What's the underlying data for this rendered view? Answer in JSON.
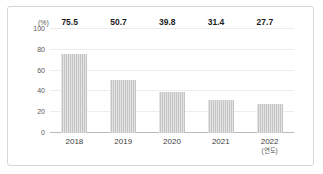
{
  "chart_data": {
    "type": "bar",
    "title": "",
    "xlabel": "(연도)",
    "ylabel": "(%)",
    "categories": [
      "2018",
      "2019",
      "2020",
      "2021",
      "2022"
    ],
    "values": [
      75.5,
      50.7,
      39.8,
      31.4,
      27.7
    ],
    "value_labels": [
      "75.5",
      "50.7",
      "39.8",
      "31.4",
      "27.7"
    ],
    "ylim": [
      0,
      100
    ],
    "yticks": [
      0,
      20,
      40,
      60,
      80,
      100
    ],
    "ytick_labels": [
      "0",
      "20",
      "40",
      "60",
      "80",
      "100"
    ],
    "grid": true,
    "legend": false,
    "colors": {
      "bar": "#c4c4c4",
      "gridline": "#ededed",
      "axis": "#b9b9b9",
      "label_text": "#1c1c1c",
      "tick_text": "#5a5a5a",
      "border": "#d6d6d6",
      "background": "#ffffff"
    }
  },
  "axis": {
    "y_unit": "(%)",
    "x_unit": "(연도)"
  }
}
